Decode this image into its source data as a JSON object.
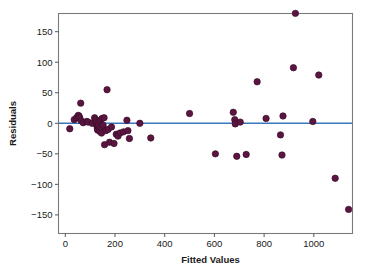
{
  "chart_data": {
    "type": "scatter",
    "title": "",
    "xlabel": "Fitted Values",
    "ylabel": "Residuals",
    "xlim": [
      -40,
      1190
    ],
    "ylim": [
      -160,
      185
    ],
    "xticks": [
      0,
      200,
      400,
      600,
      800,
      1000
    ],
    "xticklabels": [
      "0",
      "200",
      "400",
      "600",
      "800",
      "1000"
    ],
    "yticks": [
      -150,
      -100,
      -50,
      0,
      50,
      100,
      150
    ],
    "yticklabels": [
      "-150",
      "-100",
      "-50",
      "0",
      "50",
      "100",
      "150"
    ],
    "grid": false,
    "legend": null,
    "marker_color": "#5c1540",
    "marker_edge_color": "#3a0d2a",
    "marker_size": 3.2,
    "reference_line": {
      "name": "zero-residual-line",
      "type": "horizontal",
      "y": 0,
      "color": "#3b77bc",
      "width": 1.4
    },
    "frame_color": "#7a7a7a",
    "points": [
      {
        "x": 18,
        "y": -9
      },
      {
        "x": 36,
        "y": 6
      },
      {
        "x": 45,
        "y": 9
      },
      {
        "x": 52,
        "y": 13
      },
      {
        "x": 55,
        "y": 12
      },
      {
        "x": 58,
        "y": 9
      },
      {
        "x": 62,
        "y": 33
      },
      {
        "x": 64,
        "y": 4
      },
      {
        "x": 72,
        "y": 1
      },
      {
        "x": 86,
        "y": 3
      },
      {
        "x": 92,
        "y": 2
      },
      {
        "x": 108,
        "y": 0
      },
      {
        "x": 118,
        "y": 9
      },
      {
        "x": 121,
        "y": 6
      },
      {
        "x": 124,
        "y": 2
      },
      {
        "x": 126,
        "y": -2
      },
      {
        "x": 128,
        "y": -5
      },
      {
        "x": 129,
        "y": -8
      },
      {
        "x": 130,
        "y": -11
      },
      {
        "x": 132,
        "y": 1
      },
      {
        "x": 134,
        "y": -4
      },
      {
        "x": 136,
        "y": -9
      },
      {
        "x": 138,
        "y": -13
      },
      {
        "x": 140,
        "y": 5
      },
      {
        "x": 143,
        "y": -7
      },
      {
        "x": 146,
        "y": -16
      },
      {
        "x": 148,
        "y": 8
      },
      {
        "x": 152,
        "y": -3
      },
      {
        "x": 156,
        "y": 9
      },
      {
        "x": 158,
        "y": -35
      },
      {
        "x": 163,
        "y": -12
      },
      {
        "x": 168,
        "y": 55
      },
      {
        "x": 172,
        "y": -10
      },
      {
        "x": 178,
        "y": -31
      },
      {
        "x": 186,
        "y": -6
      },
      {
        "x": 196,
        "y": -33
      },
      {
        "x": 205,
        "y": -18
      },
      {
        "x": 212,
        "y": -21
      },
      {
        "x": 220,
        "y": -16
      },
      {
        "x": 234,
        "y": -14
      },
      {
        "x": 248,
        "y": 5
      },
      {
        "x": 252,
        "y": -12
      },
      {
        "x": 258,
        "y": -25
      },
      {
        "x": 300,
        "y": 0
      },
      {
        "x": 344,
        "y": -24
      },
      {
        "x": 500,
        "y": 16
      },
      {
        "x": 604,
        "y": -50
      },
      {
        "x": 676,
        "y": 18
      },
      {
        "x": 682,
        "y": 6
      },
      {
        "x": 684,
        "y": -1
      },
      {
        "x": 690,
        "y": -54
      },
      {
        "x": 704,
        "y": 2
      },
      {
        "x": 728,
        "y": -51
      },
      {
        "x": 772,
        "y": 68
      },
      {
        "x": 808,
        "y": 8
      },
      {
        "x": 866,
        "y": -19
      },
      {
        "x": 872,
        "y": -52
      },
      {
        "x": 876,
        "y": 12
      },
      {
        "x": 918,
        "y": 91
      },
      {
        "x": 926,
        "y": 180
      },
      {
        "x": 996,
        "y": 3
      },
      {
        "x": 1020,
        "y": 79
      },
      {
        "x": 1086,
        "y": -90
      },
      {
        "x": 1140,
        "y": -141
      }
    ]
  }
}
